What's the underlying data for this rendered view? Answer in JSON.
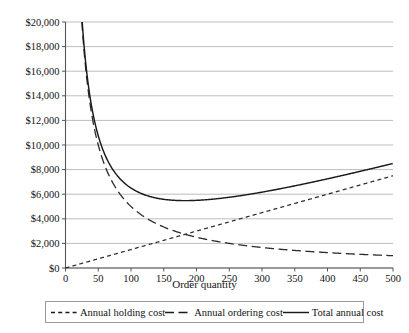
{
  "chart_data": {
    "type": "line",
    "title": "",
    "xlabel": "Order quantity",
    "ylabel": "",
    "xlim": [
      0,
      500
    ],
    "ylim": [
      0,
      20000
    ],
    "grid": true,
    "legend_position": "bottom",
    "x_ticks": [
      0,
      50,
      100,
      150,
      200,
      250,
      300,
      350,
      400,
      450,
      500
    ],
    "x_tick_labels": [
      "0",
      "50",
      "100",
      "150",
      "200",
      "250",
      "300",
      "350",
      "400",
      "450",
      "500"
    ],
    "y_ticks": [
      0,
      2000,
      4000,
      6000,
      8000,
      10000,
      12000,
      14000,
      16000,
      18000,
      20000
    ],
    "y_tick_labels": [
      "$0",
      "$2,000",
      "$4,000",
      "$6,000",
      "$8,000",
      "$10,000",
      "$12,000",
      "$14,000",
      "$16,000",
      "$18,000",
      "$20,000"
    ],
    "x": [
      25,
      50,
      75,
      100,
      125,
      150,
      175,
      200,
      225,
      250,
      275,
      300,
      325,
      350,
      375,
      400,
      425,
      450,
      475,
      500
    ],
    "series": [
      {
        "name": "Annual holding cost",
        "style": "dashed-short",
        "color": "#2b2b2b",
        "formula": "15 * Q",
        "values": [
          375,
          750,
          1125,
          1500,
          1875,
          2250,
          2625,
          3000,
          3375,
          3750,
          4125,
          4500,
          4875,
          5250,
          5625,
          6000,
          6375,
          6750,
          7125,
          7500
        ]
      },
      {
        "name": "Annual ordering cost",
        "style": "dashed-long",
        "color": "#2b2b2b",
        "formula": "500000 / Q",
        "values": [
          20000,
          10000,
          6667,
          5000,
          4000,
          3333,
          2857,
          2500,
          2222,
          2000,
          1818,
          1667,
          1538,
          1429,
          1333,
          1250,
          1176,
          1111,
          1053,
          1000
        ]
      },
      {
        "name": "Total annual cost",
        "style": "solid",
        "color": "#1a1a1a",
        "formula": "15 * Q + 500000 / Q",
        "values": [
          20375,
          10750,
          7792,
          6500,
          5875,
          5583,
          5482,
          5500,
          5597,
          5750,
          5943,
          6167,
          6413,
          6679,
          6958,
          7250,
          7551,
          7861,
          8178,
          8500
        ]
      }
    ],
    "annotations": {
      "minimum_total_cost": 5774,
      "optimal_order_quantity": 183
    }
  },
  "legend": {
    "items": [
      {
        "label": "Annual holding cost",
        "style": "dashed-short"
      },
      {
        "label": "Annual ordering cost",
        "style": "dashed-long"
      },
      {
        "label": "Total annual cost",
        "style": "solid"
      }
    ]
  }
}
